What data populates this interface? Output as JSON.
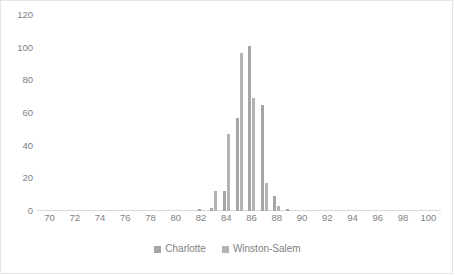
{
  "chart_data": {
    "type": "bar",
    "title": "",
    "subtitle": "",
    "xlabel": "",
    "ylabel": "",
    "xlim": [
      69,
      101
    ],
    "ylim": [
      0,
      120
    ],
    "grid": false,
    "legend_position": "bottom",
    "x_tick_labels": [
      "70",
      "72",
      "74",
      "76",
      "78",
      "80",
      "82",
      "84",
      "86",
      "88",
      "90",
      "92",
      "94",
      "96",
      "98",
      "100"
    ],
    "x_tick_values": [
      70,
      72,
      74,
      76,
      78,
      80,
      82,
      84,
      86,
      88,
      90,
      92,
      94,
      96,
      98,
      100
    ],
    "y_tick_labels": [
      "0",
      "20",
      "40",
      "60",
      "80",
      "100",
      "120"
    ],
    "y_tick_values": [
      0,
      20,
      40,
      60,
      80,
      100,
      120
    ],
    "categories": [
      82,
      83,
      84,
      85,
      86,
      87,
      88,
      89
    ],
    "series": [
      {
        "name": "Charlotte",
        "color": "#a5a5a5",
        "values": [
          1,
          2,
          12,
          57,
          101,
          65,
          9,
          1
        ]
      },
      {
        "name": "Winston-Salem",
        "color": "#b3b3b3",
        "values": [
          0,
          12,
          47,
          97,
          69,
          17,
          3,
          0
        ]
      }
    ]
  },
  "legend": {
    "items": [
      {
        "label": "Charlotte",
        "color": "#a5a5a5"
      },
      {
        "label": "Winston-Salem",
        "color": "#b3b3b3"
      }
    ]
  }
}
